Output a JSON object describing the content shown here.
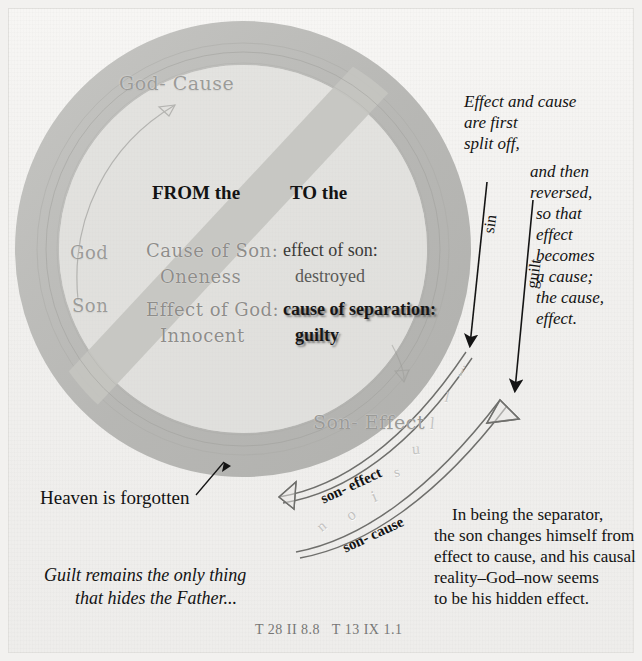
{
  "figure": {
    "citation": "T 28 II 8.8   T 13 IX 1.1"
  },
  "circle": {
    "top_label": "God- Cause",
    "bottom_label": "Son- Effect",
    "row_labels": [
      "God",
      "Son"
    ],
    "colors": {
      "ring": "#b9b9b6",
      "ring_inner": "#cfcfcb",
      "slash": "#c6c6c2",
      "background": "#f1f0ee"
    }
  },
  "table": {
    "headers": [
      "FROM the",
      "TO the"
    ],
    "rows": [
      {
        "side": "God",
        "from_line1": "Cause of Son:",
        "from_line2": "Oneness",
        "to_line1": "effect of son:",
        "to_line2": "destroyed",
        "to_bold": false
      },
      {
        "side": "Son",
        "from_line1": "Effect of God:",
        "from_line2": "Innocent",
        "to_line1": "cause of separation:",
        "to_line2": "guilty",
        "to_bold": true
      }
    ]
  },
  "annotations": {
    "right_top": [
      "Effect and cause",
      "are first",
      "split off,"
    ],
    "right_mid": [
      "and then",
      "reversed,",
      "so that",
      "effect",
      "becomes",
      "a cause;",
      "the cause,",
      "effect."
    ],
    "arrow_labels": [
      "sin",
      "guilt"
    ],
    "curve_labels": [
      "son- effect",
      "son- cause"
    ],
    "watermark": "illusion",
    "heaven_note": "Heaven is forgotten",
    "guilt_note": [
      "Guilt remains the only thing",
      "that hides the Father..."
    ],
    "separator_paragraph": [
      "In being the separator,",
      "the son changes himself from",
      "effect to cause, and his causal",
      "reality–God–now seems",
      "to be his hidden effect."
    ]
  }
}
